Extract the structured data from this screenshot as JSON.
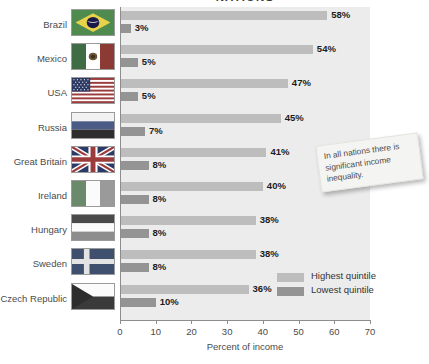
{
  "chart_data": {
    "type": "bar",
    "orientation": "horizontal",
    "title": "NATIONS",
    "xlabel": "Percent of income",
    "ylabel": "",
    "xlim": [
      0,
      70
    ],
    "xticks": [
      0,
      10,
      20,
      30,
      40,
      50,
      60,
      70
    ],
    "grid": false,
    "legend_position": "inside-bottom-right",
    "categories": [
      "Brazil",
      "Mexico",
      "USA",
      "Russia",
      "Great Britain",
      "Ireland",
      "Hungary",
      "Sweden",
      "Czech Republic"
    ],
    "series": [
      {
        "name": "Highest quintile",
        "color": "#bdbdbd",
        "values": [
          58,
          54,
          47,
          45,
          41,
          40,
          38,
          38,
          36
        ],
        "labels": [
          "58%",
          "54%",
          "47%",
          "45%",
          "41%",
          "40%",
          "38%",
          "38%",
          "36%"
        ]
      },
      {
        "name": "Lowest quintile",
        "color": "#949494",
        "values": [
          3,
          5,
          5,
          7,
          8,
          8,
          8,
          8,
          10
        ],
        "labels": [
          "3%",
          "5%",
          "5%",
          "7%",
          "8%",
          "8%",
          "8%",
          "8%",
          "10%"
        ]
      }
    ],
    "annotations": [
      {
        "text": "In all nations there is significant income inequality.",
        "kind": "sticky-note"
      }
    ]
  },
  "axis": {
    "tick_labels": [
      "0",
      "10",
      "20",
      "30",
      "40",
      "50",
      "60",
      "70"
    ],
    "x_label": "Percent of income"
  },
  "legend": {
    "entries": [
      {
        "label": "Highest quintile",
        "color": "#bdbdbd"
      },
      {
        "label": "Lowest quintile",
        "color": "#949494"
      }
    ]
  },
  "note": {
    "text": "In all nations there is significant income inequality."
  },
  "rows": [
    {
      "country": "Brazil",
      "flag": "flag-brazil",
      "high": "58%",
      "low": "3%"
    },
    {
      "country": "Mexico",
      "flag": "flag-mexico",
      "high": "54%",
      "low": "5%"
    },
    {
      "country": "USA",
      "flag": "flag-usa",
      "high": "47%",
      "low": "5%"
    },
    {
      "country": "Russia",
      "flag": "flag-russia",
      "high": "45%",
      "low": "7%"
    },
    {
      "country": "Great Britain",
      "flag": "flag-great-britain",
      "high": "41%",
      "low": "8%"
    },
    {
      "country": "Ireland",
      "flag": "flag-ireland",
      "high": "40%",
      "low": "8%"
    },
    {
      "country": "Hungary",
      "flag": "flag-hungary",
      "high": "38%",
      "low": "8%"
    },
    {
      "country": "Sweden",
      "flag": "flag-sweden",
      "high": "38%",
      "low": "8%"
    },
    {
      "country": "Czech Republic",
      "flag": "flag-czech-republic",
      "high": "36%",
      "low": "10%"
    }
  ],
  "colors": {
    "highest_quintile": "#bdbdbd",
    "lowest_quintile": "#949494",
    "plot_background": "#ececed",
    "axis": "#8d8d8d"
  }
}
